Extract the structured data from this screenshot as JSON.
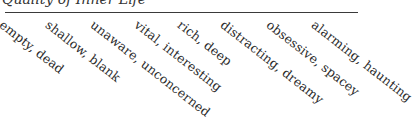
{
  "title": "Quality of Inner Life",
  "rule_color": "#3a3a3a",
  "labels": [
    {
      "text": "empty, dead",
      "x": 6
    },
    {
      "text": "shallow, blank",
      "x": 52
    },
    {
      "text": "unaware, unconcerned",
      "x": 97
    },
    {
      "text": "vital, interesting",
      "x": 141
    },
    {
      "text": "rich, deep",
      "x": 184
    },
    {
      "text": "distracting, dreamy",
      "x": 227
    },
    {
      "text": "obsessive, spacey",
      "x": 273
    },
    {
      "text": "alarming, haunting",
      "x": 318
    }
  ]
}
